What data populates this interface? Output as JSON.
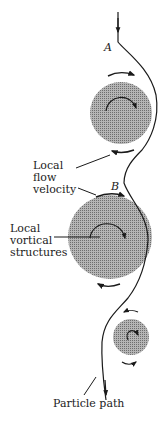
{
  "labels": {
    "point_a": "A",
    "point_b": "B",
    "flow_velocity": [
      "Local",
      "flow",
      "velocity"
    ],
    "vortical": [
      "Local",
      "vortical",
      "structures"
    ],
    "particle_path": "Particle path"
  },
  "colors": {
    "ink": "#1a1a1a",
    "vortex": "#8c8c8c"
  }
}
